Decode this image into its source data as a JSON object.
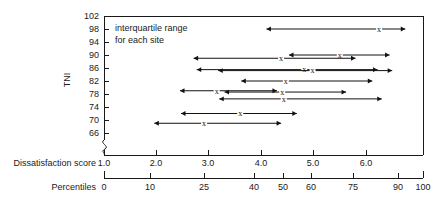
{
  "chart_data": {
    "type": "scatter",
    "title": "",
    "annotation": [
      "interquartile range",
      "for each site"
    ],
    "ylabel": "TNI",
    "xlabel_primary": "Dissatisfaction score",
    "xlabel_secondary": "Percentiles",
    "grid": false,
    "legend": "none",
    "yaxis": {
      "label": "TNI",
      "ticks": [
        66,
        70,
        74,
        78,
        82,
        86,
        90,
        94,
        98,
        102
      ],
      "ylim": [
        64,
        102
      ],
      "axis_break": true
    },
    "xaxis_primary": {
      "label": "Dissatisfaction score",
      "ticks": [
        "1.0",
        "2.0",
        "3.0",
        "4.0",
        "5.0",
        "6.0"
      ],
      "values": [
        1.0,
        2.0,
        3.0,
        4.0,
        5.0,
        6.0
      ],
      "xlim": [
        1.0,
        7.1
      ]
    },
    "xaxis_secondary": {
      "label": "Percentiles",
      "ticks": [
        "0",
        "10",
        "25",
        "40",
        "50",
        "60",
        "75",
        "90",
        "100"
      ],
      "values": [
        0,
        10,
        25,
        40,
        50,
        60,
        75,
        90,
        100
      ],
      "xlim": [
        0,
        100
      ]
    },
    "marker_symbol": "x",
    "series_note": "Each horizontal double-headed arrow is the interquartile range for one site; the x marks the median.",
    "points": [
      {
        "tni": 98,
        "low": 4.1,
        "median": 6.25,
        "high": 6.75
      },
      {
        "tni": 90,
        "low": 4.53,
        "median": 5.5,
        "high": 6.45
      },
      {
        "tni": 89,
        "low": 2.71,
        "median": 4.38,
        "high": 5.8
      },
      {
        "tni": 85.5,
        "low": 2.77,
        "median": 4.82,
        "high": 6.22
      },
      {
        "tni": 85.2,
        "low": 3.18,
        "median": 4.98,
        "high": 6.5
      },
      {
        "tni": 82,
        "low": 3.62,
        "median": 4.47,
        "high": 6.12
      },
      {
        "tni": 79,
        "low": 2.45,
        "median": 3.15,
        "high": 4.3
      },
      {
        "tni": 78.6,
        "low": 3.3,
        "median": 4.4,
        "high": 5.62
      },
      {
        "tni": 76.5,
        "low": 3.2,
        "median": 4.43,
        "high": 6.3
      },
      {
        "tni": 72,
        "low": 2.47,
        "median": 3.6,
        "high": 4.68
      },
      {
        "tni": 69,
        "low": 1.96,
        "median": 2.91,
        "high": 4.38
      }
    ]
  },
  "labels": {
    "annotation_line1": "interquartile range",
    "annotation_line2": "for each site",
    "y_axis_title": "TNI",
    "x_axis_primary_title": "Dissatisfaction score",
    "x_axis_secondary_title": "Percentiles",
    "marker": "x"
  }
}
